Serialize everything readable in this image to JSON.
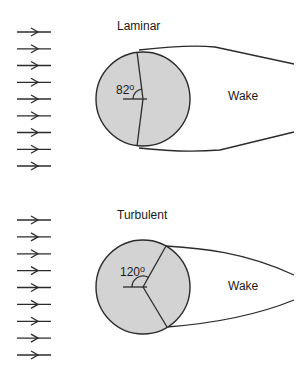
{
  "diagram": {
    "panels": [
      {
        "title": "Laminar",
        "angle_label": "82",
        "angle_unit": "o",
        "wake_label": "Wake",
        "separation_angle_deg": 82,
        "flow_arrow_count": 9
      },
      {
        "title": "Turbulent",
        "angle_label": "120",
        "angle_unit": "o",
        "wake_label": "Wake",
        "separation_angle_deg": 120,
        "flow_arrow_count": 9
      }
    ],
    "colors": {
      "cylinder_fill": "#d3d3d3",
      "line": "#2b2b2b",
      "text": "#1a1a1a",
      "background": "#ffffff"
    }
  }
}
